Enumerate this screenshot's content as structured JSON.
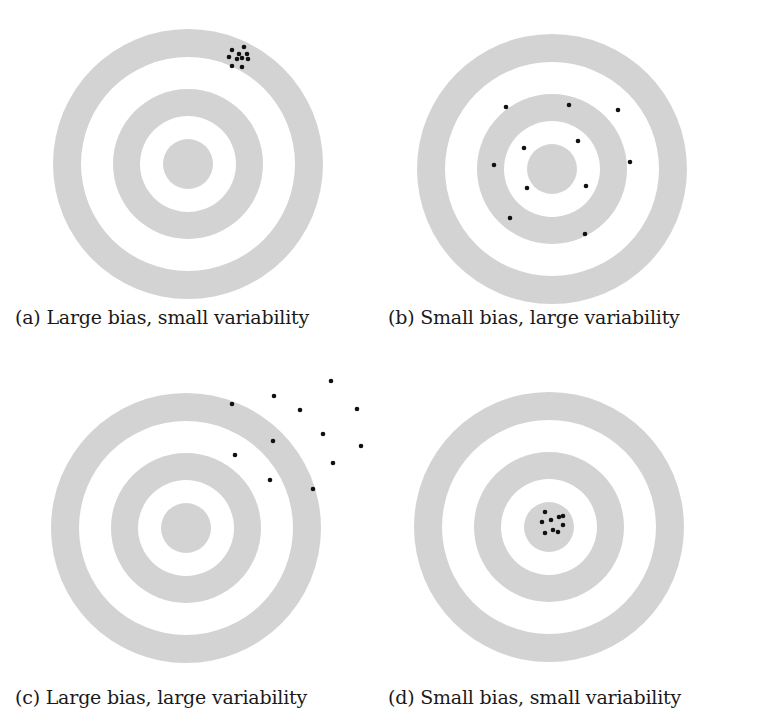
{
  "figure": {
    "colors": {
      "ring": "#d3d3d3",
      "gap": "#ffffff",
      "shot": "#111111",
      "caption": "#1a1a1a"
    },
    "ring_radii": [
      135,
      107,
      75,
      48,
      25
    ],
    "shot_radius": 2.3,
    "panels": [
      {
        "id": "a",
        "caption": "(a) Large bias, small variability",
        "center": [
          188,
          164
        ],
        "shots": [
          [
            232,
            50
          ],
          [
            244,
            47
          ],
          [
            239,
            54
          ],
          [
            247,
            54
          ],
          [
            229,
            57
          ],
          [
            237,
            59
          ],
          [
            242,
            58
          ],
          [
            248,
            59
          ],
          [
            232,
            66
          ],
          [
            242,
            67
          ]
        ]
      },
      {
        "id": "b",
        "caption": "(b) Small bias, large variability",
        "center": [
          552,
          169
        ],
        "shots": [
          [
            506,
            107
          ],
          [
            569,
            105
          ],
          [
            618,
            110
          ],
          [
            524,
            148
          ],
          [
            578,
            141
          ],
          [
            494,
            165
          ],
          [
            630,
            162
          ],
          [
            527,
            188
          ],
          [
            586,
            186
          ],
          [
            510,
            218
          ],
          [
            585,
            234
          ]
        ]
      },
      {
        "id": "c",
        "caption": "(c) Large bias, large variability",
        "center": [
          186,
          528
        ],
        "shots": [
          [
            232,
            404
          ],
          [
            274,
            396
          ],
          [
            300,
            410
          ],
          [
            331,
            381
          ],
          [
            357,
            409
          ],
          [
            273,
            441
          ],
          [
            323,
            434
          ],
          [
            361,
            446
          ],
          [
            235,
            455
          ],
          [
            270,
            480
          ],
          [
            333,
            463
          ],
          [
            313,
            489
          ]
        ]
      },
      {
        "id": "d",
        "caption": "(d) Small bias, small variability",
        "center": [
          549,
          527
        ],
        "shots": [
          [
            545,
            512
          ],
          [
            542,
            522
          ],
          [
            551,
            520
          ],
          [
            559,
            517
          ],
          [
            563,
            516
          ],
          [
            563,
            525
          ],
          [
            545,
            533
          ],
          [
            553,
            530
          ],
          [
            558,
            532
          ]
        ]
      }
    ]
  }
}
